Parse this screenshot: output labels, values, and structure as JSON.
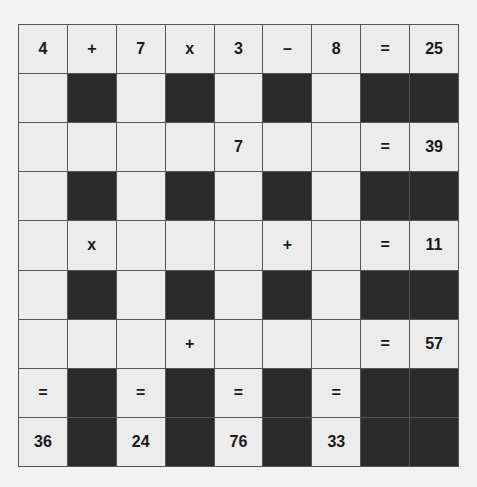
{
  "puzzle": {
    "colors": {
      "white": "#ececec",
      "black": "#2b2b2b",
      "line": "#555555",
      "text": "#1a1a1a"
    },
    "rows": [
      [
        "4",
        "+",
        "7",
        "x",
        "3",
        "–",
        "8",
        "=",
        "25"
      ],
      [
        "",
        "#",
        "",
        "#",
        "",
        "#",
        "",
        "#",
        "#"
      ],
      [
        "",
        "",
        "",
        "",
        "7",
        "",
        "",
        "=",
        "39"
      ],
      [
        "",
        "#",
        "",
        "#",
        "",
        "#",
        "",
        "#",
        "#"
      ],
      [
        "",
        "x",
        "",
        "",
        "",
        "+",
        "",
        "=",
        "11"
      ],
      [
        "",
        "#",
        "",
        "#",
        "",
        "#",
        "",
        "#",
        "#"
      ],
      [
        "",
        "",
        "",
        "+",
        "",
        "",
        "",
        "=",
        "57"
      ],
      [
        "=",
        "#",
        "=",
        "#",
        "=",
        "#",
        "=",
        "#",
        "#"
      ],
      [
        "36",
        "#",
        "24",
        "#",
        "76",
        "#",
        "33",
        "#",
        "#"
      ]
    ]
  }
}
